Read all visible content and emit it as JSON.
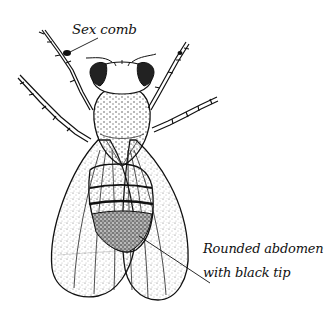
{
  "figure": {
    "colors": {
      "background": "#ffffff",
      "ink": "#111111",
      "stipple": "#555555"
    }
  },
  "labels": {
    "sex_comb": "Sex comb",
    "abdomen_line1": "Rounded abdomen",
    "abdomen_line2": "with black tip"
  }
}
